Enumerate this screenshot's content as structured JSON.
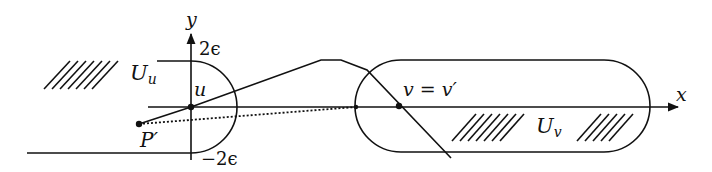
{
  "diagram": {
    "axes": {
      "x_label": "x",
      "y_label": "y",
      "y_top_tick": "2ϵ",
      "y_bottom_tick": "−2ϵ"
    },
    "regions": {
      "left": {
        "label_main": "U",
        "label_sub": "u"
      },
      "right": {
        "label_main": "U",
        "label_sub": "v"
      }
    },
    "points": {
      "u": "u",
      "p_prime": "P′",
      "v": "v = v′"
    },
    "colors": {
      "stroke": "#111111",
      "background": "#ffffff"
    }
  }
}
